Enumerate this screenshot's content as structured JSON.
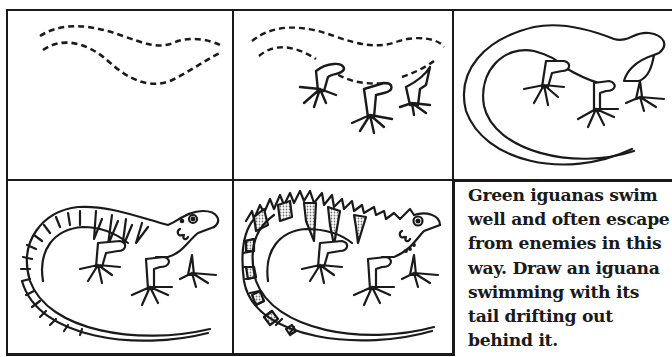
{
  "worksheet": {
    "title": "How to draw a green iguana",
    "steps": [
      {
        "step": 1,
        "description": "dashed body outline"
      },
      {
        "step": 2,
        "description": "dashed body outline with legs added"
      },
      {
        "step": 3,
        "description": "solid body outline with curled tail"
      },
      {
        "step": 4,
        "description": "iguana with stripes, eye and face details"
      },
      {
        "step": 5,
        "description": "finished iguana with dorsal spikes and stippled shading"
      }
    ],
    "caption": "Green iguanas swim\nwell and often escape\nfrom enemies in this\nway.  Draw an iguana\nswimming with its\ntail drifting out\nbehind it."
  },
  "colors": {
    "ink": "#1a1a1a",
    "paper": "#ffffff",
    "stipple": "#9a9a9a"
  }
}
